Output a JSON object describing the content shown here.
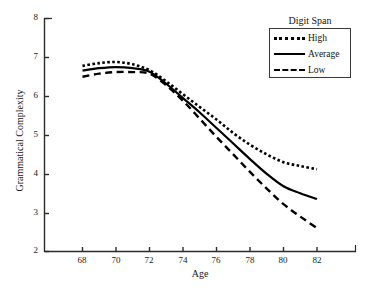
{
  "chart_data": {
    "type": "line",
    "title": "",
    "xlabel": "Age",
    "ylabel": "Grammatical Complexity",
    "xlim": [
      67,
      83
    ],
    "ylim": [
      2,
      8
    ],
    "xticks": [
      68,
      70,
      72,
      74,
      76,
      78,
      80,
      82
    ],
    "yticks": [
      2,
      3,
      4,
      5,
      6,
      7,
      8
    ],
    "grid": false,
    "legend_title": "Digit Span",
    "legend_position": "top-right",
    "x": [
      68,
      69,
      70,
      71,
      72,
      73,
      74,
      75,
      76,
      77,
      78,
      79,
      80,
      81,
      82
    ],
    "series": [
      {
        "name": "High",
        "style": "dotted",
        "color": "#000000",
        "values": [
          6.78,
          6.85,
          6.88,
          6.82,
          6.67,
          6.38,
          6.05,
          5.72,
          5.4,
          5.05,
          4.75,
          4.5,
          4.3,
          4.2,
          4.12
        ]
      },
      {
        "name": "Average",
        "style": "solid",
        "color": "#000000",
        "values": [
          6.66,
          6.72,
          6.75,
          6.72,
          6.63,
          6.32,
          5.95,
          5.58,
          5.18,
          4.78,
          4.38,
          4.0,
          3.68,
          3.5,
          3.35
        ]
      },
      {
        "name": "Low",
        "style": "dashed",
        "color": "#000000",
        "values": [
          6.5,
          6.58,
          6.62,
          6.62,
          6.58,
          6.28,
          5.88,
          5.42,
          4.95,
          4.5,
          4.05,
          3.62,
          3.22,
          2.9,
          2.6
        ]
      }
    ]
  },
  "axis": {
    "y_title": "Grammatical Complexity",
    "x_title": "Age",
    "y_tick_labels": [
      "8",
      "7",
      "6",
      "5",
      "4",
      "3",
      "2"
    ],
    "x_tick_labels": [
      "68",
      "70",
      "72",
      "74",
      "76",
      "78",
      "80",
      "82"
    ]
  },
  "legend": {
    "title": "Digit Span",
    "items": [
      {
        "label": "High"
      },
      {
        "label": "Average"
      },
      {
        "label": "Low"
      }
    ]
  }
}
